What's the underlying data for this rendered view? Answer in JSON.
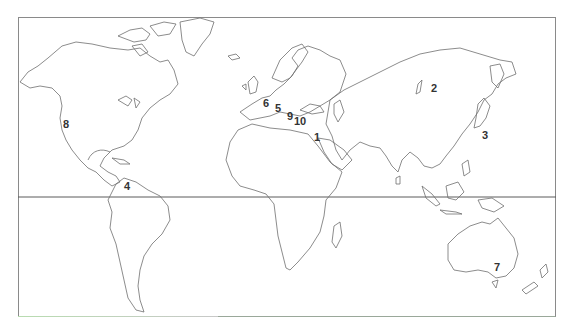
{
  "map": {
    "type": "world outline map",
    "frame": {
      "x": 18,
      "y": 17,
      "width": 538,
      "height": 300
    },
    "equator_y": 197,
    "colors": {
      "outline": "#6e6e6e",
      "frame": "#8a8a8a",
      "label": "#333333",
      "background": "#ffffff"
    },
    "labels": [
      {
        "id": "1",
        "text": "1",
        "x": 317,
        "y": 137
      },
      {
        "id": "2",
        "text": "2",
        "x": 434,
        "y": 88
      },
      {
        "id": "3",
        "text": "3",
        "x": 485,
        "y": 135
      },
      {
        "id": "4",
        "text": "4",
        "x": 127,
        "y": 186
      },
      {
        "id": "5",
        "text": "5",
        "x": 278,
        "y": 108
      },
      {
        "id": "6",
        "text": "6",
        "x": 266,
        "y": 103
      },
      {
        "id": "7",
        "text": "7",
        "x": 497,
        "y": 267
      },
      {
        "id": "8",
        "text": "8",
        "x": 66,
        "y": 124
      },
      {
        "id": "9",
        "text": "9",
        "x": 290,
        "y": 116
      },
      {
        "id": "10",
        "text": "10",
        "x": 300,
        "y": 121
      }
    ]
  }
}
